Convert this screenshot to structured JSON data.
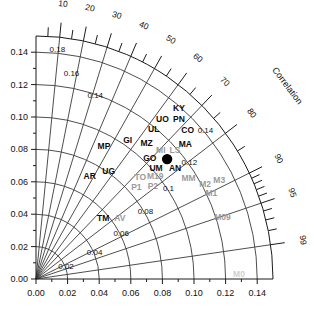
{
  "chart_data": {
    "type": "scatter",
    "title": "",
    "subtitle": "",
    "xlabel": "",
    "ylabel": "",
    "axis_title_radial": "Correlation",
    "xlim": [
      0.0,
      0.15
    ],
    "ylim": [
      0.0,
      0.15
    ],
    "grid": true,
    "legend": "none",
    "x_ticks": [
      "0.00",
      "0.02",
      "0.04",
      "0.06",
      "0.08",
      "0.10",
      "0.12",
      "0.14"
    ],
    "x_tick_values": [
      0.0,
      0.02,
      0.04,
      0.06,
      0.08,
      0.1,
      0.12,
      0.14
    ],
    "y_ticks": [
      "0.00",
      "0.02",
      "0.04",
      "0.06",
      "0.08",
      "0.10",
      "0.12",
      "0.14"
    ],
    "y_tick_values": [
      0.0,
      0.02,
      0.04,
      0.06,
      0.08,
      0.1,
      0.12,
      0.14
    ],
    "correlation_ticks": [
      "10",
      "20",
      "30",
      "40",
      "50",
      "60",
      "70",
      "80",
      "90",
      "95",
      "99"
    ],
    "correlation_tick_values": [
      0.1,
      0.2,
      0.3,
      0.4,
      0.5,
      0.6,
      0.7,
      0.8,
      0.9,
      0.95,
      0.99
    ],
    "correlation_minor_values": [
      0.05,
      0.15,
      0.25,
      0.35,
      0.45,
      0.55,
      0.65,
      0.75,
      0.85,
      0.91,
      0.92,
      0.93,
      0.94,
      0.96,
      0.97,
      0.98
    ],
    "std_arc_values": [
      0.02,
      0.04,
      0.06,
      0.08,
      0.1,
      0.12,
      0.14
    ],
    "std_arc_labels": [
      "0.02",
      "0.04",
      "0.06",
      "0.08",
      "0.1",
      "0.12",
      "0.14"
    ],
    "rms_arc_values": [
      0.14,
      0.16,
      0.18
    ],
    "rms_arc_labels": [
      "0.14",
      "0.16",
      "0.18"
    ],
    "reference": {
      "label": "reference",
      "std": 0.111,
      "corr": 0.0,
      "x": 0.083,
      "y": 0.074
    },
    "points": [
      {
        "label": "KY",
        "x": 0.0905,
        "y": 0.1035,
        "color": "black"
      },
      {
        "label": "UO",
        "x": 0.08,
        "y": 0.097,
        "color": "black"
      },
      {
        "label": "PN",
        "x": 0.0905,
        "y": 0.097,
        "color": "black"
      },
      {
        "label": "UL",
        "x": 0.0745,
        "y": 0.0905,
        "color": "black"
      },
      {
        "label": "CO",
        "x": 0.096,
        "y": 0.09,
        "color": "black"
      },
      {
        "label": "MZ",
        "x": 0.07,
        "y": 0.082,
        "color": "black"
      },
      {
        "label": "MA",
        "x": 0.0945,
        "y": 0.0815,
        "color": "black"
      },
      {
        "label": "GI",
        "x": 0.058,
        "y": 0.084,
        "color": "black"
      },
      {
        "label": "MP",
        "x": 0.043,
        "y": 0.08,
        "color": "black"
      },
      {
        "label": "MI",
        "x": 0.079,
        "y": 0.0775,
        "color": "gray"
      },
      {
        "label": "LS",
        "x": 0.088,
        "y": 0.0775,
        "color": "gray"
      },
      {
        "label": "GO",
        "x": 0.072,
        "y": 0.073,
        "color": "black"
      },
      {
        "label": "UM",
        "x": 0.076,
        "y": 0.0665,
        "color": "black"
      },
      {
        "label": "AN",
        "x": 0.088,
        "y": 0.0665,
        "color": "black"
      },
      {
        "label": "AR",
        "x": 0.034,
        "y": 0.062,
        "color": "black"
      },
      {
        "label": "UG",
        "x": 0.046,
        "y": 0.065,
        "color": "black"
      },
      {
        "label": "TO",
        "x": 0.066,
        "y": 0.061,
        "color": "gray"
      },
      {
        "label": "M19",
        "x": 0.0755,
        "y": 0.0615,
        "color": "gray"
      },
      {
        "label": "P1",
        "x": 0.0635,
        "y": 0.055,
        "color": "gray"
      },
      {
        "label": "P2",
        "x": 0.074,
        "y": 0.0555,
        "color": "gray"
      },
      {
        "label": "MM",
        "x": 0.0965,
        "y": 0.0605,
        "color": "gray"
      },
      {
        "label": "M2",
        "x": 0.107,
        "y": 0.057,
        "color": "gray"
      },
      {
        "label": "M3",
        "x": 0.116,
        "y": 0.059,
        "color": "gray"
      },
      {
        "label": "M1",
        "x": 0.111,
        "y": 0.0515,
        "color": "gray"
      },
      {
        "label": "TM",
        "x": 0.0425,
        "y": 0.0355,
        "color": "black"
      },
      {
        "label": "AV",
        "x": 0.053,
        "y": 0.0355,
        "color": "gray"
      },
      {
        "label": "M09",
        "x": 0.118,
        "y": 0.0365,
        "color": "gray"
      },
      {
        "label": "M0",
        "x": 0.1285,
        "y": 0.0015,
        "color": "faint"
      }
    ]
  },
  "colors": {
    "axis": "#1a1a1a",
    "arc": "#3a3a3a",
    "black_point": "#0b0b0b",
    "gray_point": "#9a9a9a",
    "faint_point": "#cfcfcf",
    "background": "#ffffff"
  }
}
